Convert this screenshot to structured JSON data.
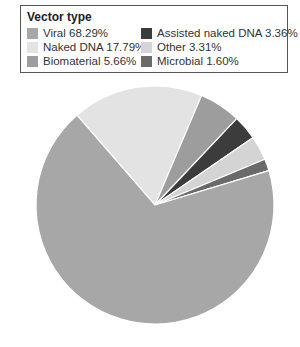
{
  "chart_data": {
    "type": "pie",
    "title": "Vector type",
    "legend_position": "top",
    "categories": [
      "Viral",
      "Naked DNA",
      "Biomaterial",
      "Assisted naked DNA",
      "Other",
      "Microbial"
    ],
    "values": [
      68.29,
      17.79,
      5.66,
      3.36,
      3.31,
      1.6
    ],
    "unit": "%",
    "colors": [
      "#a7a7a7",
      "#e3e3e3",
      "#9d9d9d",
      "#3c3c3c",
      "#d4d4d4",
      "#6a6a6a"
    ],
    "slice_order_clockwise": [
      "Naked DNA",
      "Biomaterial",
      "Assisted naked DNA",
      "Other",
      "Microbial",
      "Viral"
    ],
    "start_angle_deg": -41
  },
  "legend": {
    "title": "Vector type",
    "items": [
      {
        "label": "Viral 68.29%",
        "color": "#a7a7a7"
      },
      {
        "label": "Assisted naked DNA 3.36%",
        "color": "#3c3c3c"
      },
      {
        "label": "Naked DNA 17.79%",
        "color": "#e3e3e3"
      },
      {
        "label": "Other 3.31%",
        "color": "#d4d4d4"
      },
      {
        "label": "Biomaterial 5.66%",
        "color": "#9d9d9d"
      },
      {
        "label": "Microbial 1.60%",
        "color": "#6a6a6a"
      }
    ]
  }
}
